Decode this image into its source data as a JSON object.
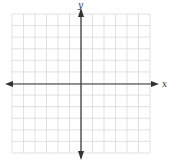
{
  "figure": {
    "type": "coordinate-plane",
    "x_axis_label": "x",
    "y_axis_label": "y",
    "grid_columns": 12,
    "grid_rows": 12,
    "grid_left": 12,
    "grid_top": 14,
    "grid_right": 150,
    "grid_bottom": 153,
    "origin_x": 81,
    "origin_y": 84,
    "colors": {
      "grid": "#d9d9d9",
      "axis": "#333333",
      "background": "#ffffff"
    }
  }
}
